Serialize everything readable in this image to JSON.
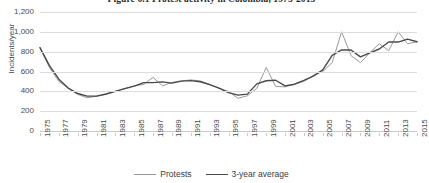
{
  "chart_data": {
    "type": "line",
    "title": "Figure 6.1 Protest activity in Colombia, 1975-2015",
    "xlabel": "",
    "ylabel": "Incidents/year",
    "ylim": [
      0,
      1200
    ],
    "ytick_step": 200,
    "ytick_labels": [
      "1,200",
      "1,000",
      "800",
      "600",
      "400",
      "200",
      "0"
    ],
    "ytick_values": [
      1200,
      1000,
      800,
      600,
      400,
      200,
      0
    ],
    "grid": true,
    "legend_position": "bottom",
    "x": [
      1975,
      1976,
      1977,
      1978,
      1979,
      1980,
      1981,
      1982,
      1983,
      1984,
      1985,
      1986,
      1987,
      1988,
      1989,
      1990,
      1991,
      1992,
      1993,
      1994,
      1995,
      1996,
      1997,
      1998,
      1999,
      2000,
      2001,
      2002,
      2003,
      2004,
      2005,
      2006,
      2007,
      2008,
      2009,
      2010,
      2011,
      2012,
      2013,
      2014,
      2015
    ],
    "xtick_labels": [
      "1975",
      "1977",
      "1979",
      "1981",
      "1983",
      "1985",
      "1987",
      "1989",
      "1991",
      "1993",
      "1995",
      "1997",
      "1999",
      "2001",
      "2003",
      "2005",
      "2007",
      "2009",
      "2011",
      "2013",
      "2015"
    ],
    "xtick_values": [
      1975,
      1977,
      1979,
      1981,
      1983,
      1985,
      1987,
      1989,
      1991,
      1993,
      1995,
      1997,
      1999,
      2001,
      2003,
      2005,
      2007,
      2009,
      2011,
      2013,
      2015
    ],
    "xlim": [
      1975,
      2015
    ],
    "series": [
      {
        "name": "Protests",
        "color": "#9a9a9a",
        "width": 1.0,
        "values": [
          840,
          640,
          500,
          430,
          370,
          335,
          350,
          370,
          400,
          430,
          455,
          470,
          540,
          455,
          490,
          505,
          515,
          505,
          470,
          430,
          400,
          330,
          355,
          430,
          640,
          450,
          445,
          470,
          500,
          560,
          600,
          690,
          1000,
          760,
          690,
          790,
          880,
          810,
          1000,
          880,
          900
        ]
      },
      {
        "name": "3-year average",
        "color": "#4a4a4a",
        "width": 1.4,
        "values": [
          840,
          660,
          523,
          433,
          378,
          352,
          352,
          373,
          400,
          428,
          452,
          488,
          488,
          495,
          483,
          503,
          508,
          497,
          468,
          433,
          387,
          362,
          372,
          475,
          507,
          512,
          455,
          472,
          510,
          553,
          617,
          763,
          817,
          817,
          747,
          787,
          827,
          897,
          897,
          927,
          900
        ]
      }
    ]
  },
  "legend": {
    "items": [
      {
        "label": "Protests",
        "color": "#9a9a9a"
      },
      {
        "label": "3-year average",
        "color": "#4a4a4a"
      }
    ]
  }
}
